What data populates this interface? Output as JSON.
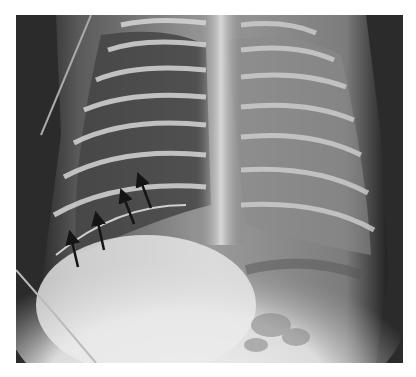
{
  "figure": {
    "type": "radiograph",
    "view": "frontal chest-abdomen",
    "arrows": [
      {
        "x1": 78,
        "y1": 268,
        "x2": 69,
        "y2": 232
      },
      {
        "x1": 104,
        "y1": 250,
        "x2": 95,
        "y2": 215
      },
      {
        "x1": 135,
        "y1": 224,
        "x2": 119,
        "y2": 192
      },
      {
        "x1": 152,
        "y1": 208,
        "x2": 135,
        "y2": 176
      }
    ],
    "arrow_color": "#151515",
    "background_color": "#ffffff"
  }
}
